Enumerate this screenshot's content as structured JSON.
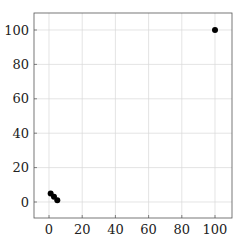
{
  "chart_data": {
    "type": "scatter",
    "title": "",
    "xlabel": "",
    "ylabel": "",
    "xlim": [
      -8,
      110
    ],
    "ylim": [
      -9,
      110
    ],
    "grid": true,
    "legend": null,
    "x_ticks": [
      0,
      20,
      40,
      60,
      80,
      100
    ],
    "y_ticks": [
      0,
      20,
      40,
      60,
      80,
      100
    ],
    "series": [
      {
        "name": "points",
        "color": "#000000",
        "points": [
          {
            "x": 1,
            "y": 5
          },
          {
            "x": 3,
            "y": 3
          },
          {
            "x": 5,
            "y": 1
          },
          {
            "x": 100,
            "y": 100
          }
        ]
      }
    ]
  }
}
